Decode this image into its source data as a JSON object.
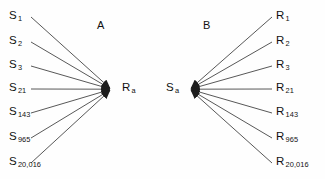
{
  "figure": {
    "background_color": "#fefefe",
    "line_color": "#2b2b2b",
    "text_color": "#111111"
  },
  "panels": [
    {
      "id": "panel-a",
      "label": "A",
      "hub": {
        "base": "R",
        "sub": "a"
      },
      "direction": "converging",
      "leaves": [
        {
          "base": "S",
          "sub": "1"
        },
        {
          "base": "S",
          "sub": "2"
        },
        {
          "base": "S",
          "sub": "3"
        },
        {
          "base": "S",
          "sub": "21"
        },
        {
          "base": "S",
          "sub": "143"
        },
        {
          "base": "S",
          "sub": "965"
        },
        {
          "base": "S",
          "sub": "20,016"
        }
      ]
    },
    {
      "id": "panel-b",
      "label": "B",
      "hub": {
        "base": "S",
        "sub": "a"
      },
      "direction": "diverging",
      "leaves": [
        {
          "base": "R",
          "sub": "1"
        },
        {
          "base": "R",
          "sub": "2"
        },
        {
          "base": "R",
          "sub": "3"
        },
        {
          "base": "R",
          "sub": "21"
        },
        {
          "base": "R",
          "sub": "143"
        },
        {
          "base": "R",
          "sub": "965"
        },
        {
          "base": "R",
          "sub": "20,016"
        }
      ]
    }
  ]
}
